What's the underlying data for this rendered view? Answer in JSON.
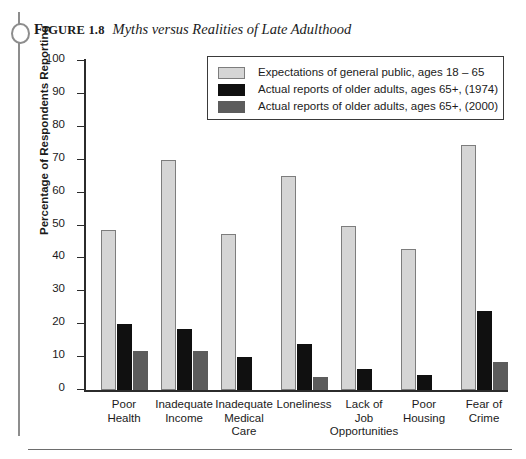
{
  "figure": {
    "label_prefix": "F",
    "label_rest": "IGURE",
    "number": "1.8",
    "title": "Myths versus Realities of Late Adulthood",
    "ring_icon": "binder-ring-icon"
  },
  "chart_data": {
    "type": "bar",
    "title": "Myths versus Realities of Late Adulthood",
    "xlabel": "",
    "ylabel": "Percentage of Respondents Reporting",
    "ylim": [
      0,
      100
    ],
    "yticks": [
      0,
      10,
      20,
      30,
      40,
      50,
      60,
      70,
      80,
      90,
      100
    ],
    "ytick_labels": [
      "0",
      "10",
      "20",
      "30",
      "40",
      "50",
      "60",
      "70",
      "80",
      "90",
      "100"
    ],
    "grid": false,
    "legend_position": "upper-center",
    "categories": [
      "Poor\nHealth",
      "Inadequate\nIncome",
      "Inadequate\nMedical\nCare",
      "Loneliness",
      "Lack of\nJob\nOpportunities",
      "Poor\nHousing",
      "Fear of\nCrime"
    ],
    "series": [
      {
        "name": "Expectations of general public, ages 18 – 65",
        "color": "#d5d5d5",
        "values": [
          48.5,
          70,
          47.5,
          65,
          50,
          43,
          74.5
        ]
      },
      {
        "name": "Actual reports of older adults, ages 65+, (1974)",
        "color": "#101010",
        "values": [
          20,
          18.5,
          10,
          14,
          6.5,
          4.5,
          24
        ]
      },
      {
        "name": "Actual reports of older adults, ages 65+, (2000)",
        "color": "#5c5c5c",
        "values": [
          12,
          12,
          0,
          4,
          0,
          0,
          8.5
        ]
      }
    ]
  }
}
